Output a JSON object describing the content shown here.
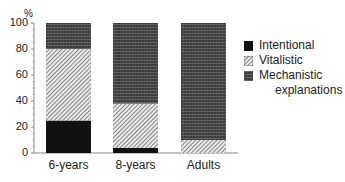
{
  "chart_data": {
    "type": "bar",
    "stacked": true,
    "title": "",
    "xlabel": "",
    "ylabel": "%",
    "ylim": [
      0,
      100
    ],
    "yticks": [
      0,
      20,
      40,
      60,
      80,
      100
    ],
    "grid": false,
    "legend_position": "right",
    "categories": [
      "6-years",
      "8-years",
      "Adults"
    ],
    "series": [
      {
        "name": "Intentional",
        "pattern": "solid-black",
        "values": [
          25,
          4,
          0
        ]
      },
      {
        "name": "Vitalistic",
        "pattern": "diagonal-hatch",
        "values": [
          55,
          34,
          10
        ]
      },
      {
        "name": "Mechanistic explanations",
        "pattern": "dense-grid",
        "values": [
          20,
          62,
          90
        ]
      }
    ]
  },
  "axis": {
    "unit_label": "%",
    "ytick_labels": [
      "0",
      "20",
      "40",
      "60",
      "80",
      "100"
    ]
  },
  "xlabels": [
    "6-years",
    "8-years",
    "Adults"
  ],
  "legend": {
    "items": [
      {
        "label": "Intentional"
      },
      {
        "label": "Vitalistic"
      },
      {
        "label": "Mechanistic"
      }
    ],
    "continuation": "explanations"
  },
  "colors": {
    "intentional": "#111111",
    "vitalistic_bg": "#e6e6e6",
    "vitalistic_line": "#555555",
    "mechanistic_bg": "#3a3a3a",
    "mechanistic_line": "#777777",
    "axis": "#888888"
  }
}
